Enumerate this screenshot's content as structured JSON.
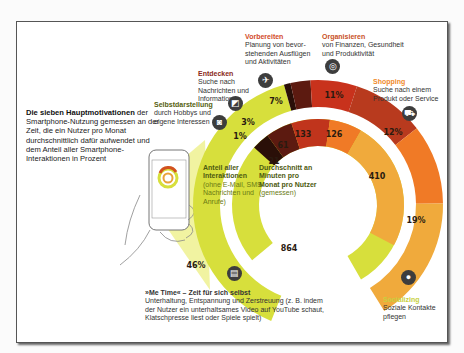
{
  "intro": {
    "title": "Die sieben Hauptmotivationen",
    "text": "der Smartphone-Nutzung gemessen an der Zeit, die ein Nutzer pro Monat durchschnittlich dafür aufwendet und dem Anteil aller Smartphone-Interaktionen in Prozent"
  },
  "center": {
    "outer_title": "Anteil aller Interaktionen",
    "outer_note": "(ohne E-Mail, SMS-Nachrichten und Anrufe)",
    "inner_title": "Durchschnitt an Minuten pro Monat pro Nutzer",
    "inner_note": "(gemessen)"
  },
  "categories": [
    {
      "key": "metime",
      "title": "»Me Time« – Zeit für sich selbst",
      "desc": "Unterhaltung, Entspannung und Zerstreuung (z. B. indem der Nutzer ein unterhaltsames Video auf YouTube schaut, Klatschpresse liest oder Spiele spielt)",
      "share": "46%",
      "minutes": "864",
      "color": "#d7df3c",
      "title_color": "#222222",
      "icon": "film-icon"
    },
    {
      "key": "selbst",
      "title": "Selbstdarstellung",
      "desc": "durch Hobbys und eigene Interessen",
      "share": "1%",
      "minutes": "21",
      "color": "#2a0f08",
      "title_color": "#6b6b1a",
      "icon": "camera-icon"
    },
    {
      "key": "entdecken",
      "title": "Entdecken",
      "desc": "Suche nach Nachrichten und Informationen",
      "share": "3%",
      "minutes": "61",
      "color": "#5c1a10",
      "title_color": "#8a2a20",
      "icon": "newspaper-icon"
    },
    {
      "key": "vorbereiten",
      "title": "Vorbereiten",
      "desc": "Planung von bevor-stehenden Ausflügen und Aktivitäten",
      "share": "7%",
      "minutes": "133",
      "color": "#c8321c",
      "title_color": "#d24a2a",
      "icon": "airplane-icon"
    },
    {
      "key": "organisieren",
      "title": "Organisieren",
      "desc": "von Finanzen, Gesundheit und Produktivität",
      "share": "11%",
      "minutes": "126",
      "color": "#b83a1e",
      "title_color": "#c8501e",
      "icon": "stopwatch-icon"
    },
    {
      "key": "shopping",
      "title": "Shopping",
      "desc": "Suche nach einem Produkt oder Service",
      "share": "12%",
      "minutes": "410",
      "color": "#f07a26",
      "title_color": "#f08a2a",
      "icon": "cart-icon"
    },
    {
      "key": "socializing",
      "title": "Socializing",
      "desc": "Soziale Kontakte pflegen",
      "share": "19%",
      "minutes": "",
      "color": "#f0aa3c",
      "title_color": "#c8d040",
      "icon": "chat-bubble-icon"
    }
  ],
  "chart_data": {
    "type": "pie",
    "title": "Die sieben Hauptmotivationen der Smartphone-Nutzung",
    "categories": [
      "Me Time",
      "Selbstdarstellung",
      "Entdecken",
      "Vorbereiten",
      "Organisieren",
      "Shopping",
      "Socializing"
    ],
    "series": [
      {
        "name": "Anteil aller Interaktionen (%)",
        "values": [
          46,
          1,
          3,
          7,
          11,
          12,
          19
        ]
      },
      {
        "name": "Durchschnitt an Minuten pro Monat pro Nutzer",
        "values": [
          864,
          21,
          61,
          133,
          126,
          410,
          null
        ]
      }
    ],
    "labels": {
      "outer": [
        "46%",
        "1%",
        "3%",
        "7%",
        "11%",
        "12%",
        "19%"
      ],
      "inner": [
        "864",
        "21",
        "61",
        "133",
        "126",
        "410"
      ]
    }
  }
}
